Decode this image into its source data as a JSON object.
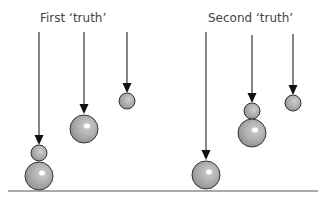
{
  "diagram": {
    "titles": {
      "first": "First ‘truth’",
      "second": "Second ‘truth’"
    },
    "colors": {
      "line": "#333333",
      "ball_fill": "#a8a8a8",
      "ball_stroke": "#333333",
      "highlight": "#ffffff",
      "ground": "#555555",
      "title": "#444444"
    },
    "ground": {
      "y": 191,
      "x1": 8,
      "x2": 318
    },
    "groups": [
      {
        "name": "first-truth",
        "title_key": "first",
        "drops": [
          {
            "x": 39,
            "line_top": 32,
            "arrow_tip": 145,
            "balls": [
              {
                "cy": 153,
                "r": 8,
                "size": "small"
              },
              {
                "cy": 176,
                "r": 14,
                "size": "large"
              }
            ]
          },
          {
            "x": 84,
            "line_top": 32,
            "arrow_tip": 114,
            "balls": [
              {
                "cy": 129,
                "r": 14,
                "size": "large"
              }
            ]
          },
          {
            "x": 127,
            "line_top": 32,
            "arrow_tip": 93,
            "balls": [
              {
                "cy": 101,
                "r": 8,
                "size": "small"
              }
            ]
          }
        ]
      },
      {
        "name": "second-truth",
        "title_key": "second",
        "drops": [
          {
            "x": 206,
            "line_top": 32,
            "arrow_tip": 160,
            "balls": [
              {
                "cy": 175,
                "r": 14,
                "size": "large"
              }
            ]
          },
          {
            "x": 252,
            "line_top": 35,
            "arrow_tip": 103,
            "balls": [
              {
                "cy": 111,
                "r": 8,
                "size": "small"
              },
              {
                "cy": 133,
                "r": 14,
                "size": "large"
              }
            ]
          },
          {
            "x": 293,
            "line_top": 34,
            "arrow_tip": 95,
            "balls": [
              {
                "cy": 103,
                "r": 8,
                "size": "small"
              }
            ]
          }
        ]
      }
    ]
  }
}
